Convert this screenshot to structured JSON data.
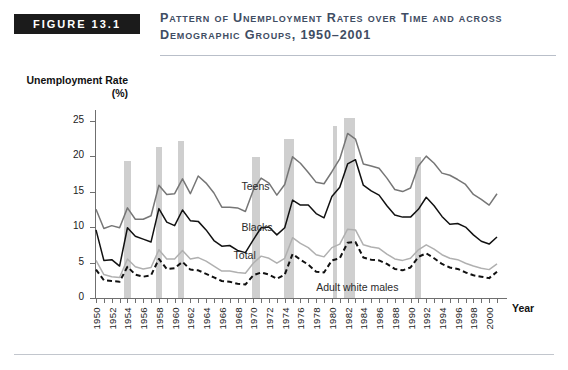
{
  "header": {
    "badge": "FIGURE 13.1",
    "title": "Pattern of Unemployment Rates over Time and across Demographic Groups, 1950–2001"
  },
  "axes": {
    "y_title": "Unemployment Rate (%)",
    "y_ticks": [
      "0",
      "5",
      "10",
      "15",
      "20",
      "25"
    ],
    "y_values": [
      0,
      5,
      10,
      15,
      20,
      25
    ],
    "ylim": [
      0,
      26.5
    ],
    "x_title": "Year",
    "x_ticks": [
      "1950",
      "1952",
      "1954",
      "1956",
      "1958",
      "1960",
      "1962",
      "1964",
      "1966",
      "1968",
      "1970",
      "1972",
      "1974",
      "1976",
      "1978",
      "1980",
      "1982",
      "1984",
      "1986",
      "1988",
      "1990",
      "1992",
      "1994",
      "1996",
      "1998",
      "2000"
    ],
    "xlim": [
      1950,
      2001
    ]
  },
  "series_labels": {
    "teens": "Teens",
    "blacks": "Blacks",
    "total": "Total",
    "adult_white_males": "Adult white males"
  },
  "colors": {
    "teens": "#767676",
    "blacks": "#111111",
    "total": "#b0b0b0",
    "adult_white_males": "#111111",
    "recession_band": "#cfcfcf",
    "badge_background": "#1b1b1b",
    "badge_text": "#ffffff",
    "title_text": "#3f4d63",
    "axis": "#6f6f6f"
  },
  "chart_data": {
    "type": "line",
    "title": "Pattern of Unemployment Rates over Time and across Demographic Groups, 1950–2001",
    "xlabel": "Year",
    "ylabel": "Unemployment Rate (%)",
    "xlim": [
      1950,
      2001
    ],
    "ylim": [
      0,
      26.5
    ],
    "grid": false,
    "legend": "inline-annotations",
    "x": [
      1950,
      1951,
      1952,
      1953,
      1954,
      1955,
      1956,
      1957,
      1958,
      1959,
      1960,
      1961,
      1962,
      1963,
      1964,
      1965,
      1966,
      1967,
      1968,
      1969,
      1970,
      1971,
      1972,
      1973,
      1974,
      1975,
      1976,
      1977,
      1978,
      1979,
      1980,
      1981,
      1982,
      1983,
      1984,
      1985,
      1986,
      1987,
      1988,
      1989,
      1990,
      1991,
      1992,
      1993,
      1994,
      1995,
      1996,
      1997,
      1998,
      1999,
      2000,
      2001
    ],
    "series": [
      {
        "name": "Teens",
        "color": "#767676",
        "style": "solid",
        "values": [
          12.5,
          9.8,
          10.2,
          9.9,
          12.7,
          11.1,
          11.1,
          11.6,
          15.9,
          14.6,
          14.7,
          16.8,
          14.7,
          17.2,
          16.2,
          14.8,
          12.8,
          12.8,
          12.7,
          12.2,
          15.2,
          16.9,
          16.2,
          14.5,
          16.0,
          19.9,
          19.0,
          17.7,
          16.3,
          16.1,
          17.8,
          19.6,
          23.2,
          22.4,
          18.9,
          18.6,
          18.3,
          16.9,
          15.3,
          15.0,
          15.5,
          18.6,
          20.0,
          19.0,
          17.6,
          17.3,
          16.7,
          16.0,
          14.6,
          13.9,
          13.1,
          14.7
        ]
      },
      {
        "name": "Blacks",
        "color": "#111111",
        "style": "solid",
        "values": [
          9.6,
          5.3,
          5.4,
          4.5,
          9.9,
          8.7,
          8.3,
          7.9,
          12.6,
          10.7,
          10.2,
          12.4,
          10.9,
          10.8,
          9.6,
          8.1,
          7.3,
          7.4,
          6.7,
          6.4,
          8.2,
          9.9,
          10.0,
          8.9,
          9.9,
          13.8,
          13.1,
          13.1,
          11.9,
          11.3,
          14.3,
          15.6,
          18.9,
          19.5,
          15.9,
          15.1,
          14.5,
          13.0,
          11.7,
          11.4,
          11.4,
          12.5,
          14.2,
          13.0,
          11.5,
          10.4,
          10.5,
          10.0,
          8.9,
          8.0,
          7.6,
          8.6
        ]
      },
      {
        "name": "Total",
        "color": "#b0b0b0",
        "style": "solid",
        "values": [
          5.3,
          3.3,
          3.0,
          2.9,
          5.5,
          4.4,
          4.1,
          4.3,
          6.8,
          5.5,
          5.5,
          6.7,
          5.5,
          5.7,
          5.2,
          4.5,
          3.8,
          3.8,
          3.6,
          3.5,
          4.9,
          5.9,
          5.6,
          4.9,
          5.6,
          8.5,
          7.7,
          7.1,
          6.1,
          5.8,
          7.1,
          7.6,
          9.7,
          9.6,
          7.5,
          7.2,
          7.0,
          6.2,
          5.5,
          5.3,
          5.6,
          6.8,
          7.5,
          6.9,
          6.1,
          5.6,
          5.4,
          4.9,
          4.5,
          4.2,
          4.0,
          4.8
        ]
      },
      {
        "name": "Adult white males",
        "color": "#111111",
        "style": "dashed",
        "values": [
          4.0,
          2.5,
          2.4,
          2.3,
          4.4,
          3.3,
          3.0,
          3.2,
          5.5,
          4.1,
          4.2,
          5.1,
          4.0,
          3.9,
          3.4,
          2.9,
          2.4,
          2.3,
          2.0,
          1.9,
          3.2,
          3.6,
          3.3,
          2.7,
          3.3,
          6.2,
          5.4,
          4.7,
          3.7,
          3.6,
          5.3,
          5.6,
          7.8,
          7.9,
          5.7,
          5.4,
          5.3,
          4.8,
          4.1,
          3.9,
          4.3,
          5.8,
          6.3,
          5.6,
          4.8,
          4.3,
          4.1,
          3.6,
          3.2,
          3.0,
          2.8,
          3.7
        ]
      }
    ],
    "recession_bands": [
      {
        "start": 1953.5,
        "end": 1954.4,
        "top_value": 19.3
      },
      {
        "start": 1957.6,
        "end": 1958.4,
        "top_value": 21.3
      },
      {
        "start": 1960.4,
        "end": 1961.2,
        "top_value": 22.2
      },
      {
        "start": 1969.9,
        "end": 1970.8,
        "top_value": 19.9
      },
      {
        "start": 1973.9,
        "end": 1975.2,
        "top_value": 22.4
      },
      {
        "start": 1980.1,
        "end": 1980.6,
        "top_value": 24.3
      },
      {
        "start": 1981.6,
        "end": 1982.9,
        "top_value": 25.4
      },
      {
        "start": 1990.6,
        "end": 1991.3,
        "top_value": 19.9
      }
    ]
  },
  "annotations": [
    {
      "text": "Teens",
      "x_value": 1968.5,
      "y_value": 15.6
    },
    {
      "text": "Blacks",
      "x_value": 1968.5,
      "y_value": 9.8
    },
    {
      "text": "Total",
      "x_value": 1967.5,
      "y_value": 5.9
    },
    {
      "text": "Adult white males",
      "x_value": 1978.0,
      "y_value": 1.4
    }
  ]
}
